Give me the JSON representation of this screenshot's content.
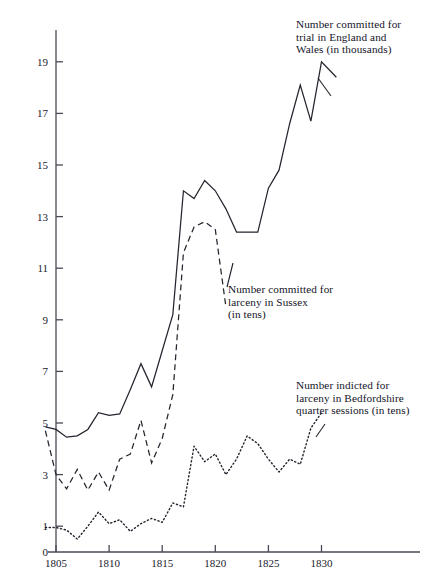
{
  "figure": {
    "kind": "line-chart",
    "background": "#ffffff",
    "ink_color": "#25252f"
  },
  "annotations": {
    "england": "Number committed for\ntrial in England and\nWales (in thousands)",
    "sussex": "Number committed for\nlarceny in Sussex\n(in tens)",
    "bedford": "Number indicted for\nlarceny in Bedfordshire\nquarter sessions (in tens)"
  },
  "axes": {
    "y_ticks": [
      "19",
      "17",
      "15",
      "13",
      "11",
      "9",
      "7",
      "5",
      "3",
      "1",
      "0"
    ],
    "x_ticks": [
      "1805",
      "1810",
      "1815",
      "1820",
      "1825",
      "1830"
    ]
  },
  "chart_data": {
    "type": "line",
    "title": "",
    "xlabel": "",
    "ylabel": "",
    "xlim": [
      1804,
      1831
    ],
    "ylim": [
      0,
      20
    ],
    "grid": false,
    "legend": "inline-annotations",
    "x": [
      1804,
      1805,
      1806,
      1807,
      1808,
      1809,
      1810,
      1811,
      1812,
      1813,
      1814,
      1815,
      1816,
      1817,
      1818,
      1819,
      1820,
      1821,
      1822,
      1823,
      1824,
      1825,
      1826,
      1827,
      1828,
      1829,
      1830
    ],
    "series": [
      {
        "name": "Number committed for trial in England and Wales (in thousands)",
        "style": "solid",
        "units": "thousands",
        "values": [
          4.85,
          4.75,
          4.45,
          4.5,
          4.75,
          5.4,
          5.3,
          5.35,
          6.3,
          7.3,
          6.4,
          7.8,
          9.2,
          14.0,
          13.7,
          14.4,
          14.0,
          13.3,
          12.4,
          12.4,
          12.4,
          14.1,
          14.8,
          16.6,
          18.1,
          16.7,
          19.0
        ]
      },
      {
        "name": "Number committed for larceny in Sussex (in tens)",
        "style": "dashed",
        "units": "tens",
        "values": [
          4.7,
          3.0,
          2.45,
          3.2,
          2.4,
          3.1,
          2.4,
          3.6,
          3.8,
          5.1,
          3.45,
          4.4,
          6.1,
          11.6,
          12.6,
          12.8,
          12.5,
          9.5,
          null,
          null,
          null,
          null,
          null,
          null,
          null,
          null,
          null
        ]
      },
      {
        "name": "Number indicted for larceny in Bedfordshire quarter sessions (in tens)",
        "style": "dotted",
        "units": "tens",
        "values": [
          0.95,
          0.95,
          0.85,
          0.5,
          1.0,
          1.55,
          1.1,
          1.25,
          0.8,
          1.1,
          1.3,
          1.15,
          1.9,
          1.75,
          4.1,
          3.5,
          3.8,
          3.0,
          3.6,
          4.5,
          4.2,
          3.6,
          3.1,
          3.6,
          3.4,
          4.8,
          5.4
        ]
      }
    ]
  },
  "last_solid_point": 18.4
}
